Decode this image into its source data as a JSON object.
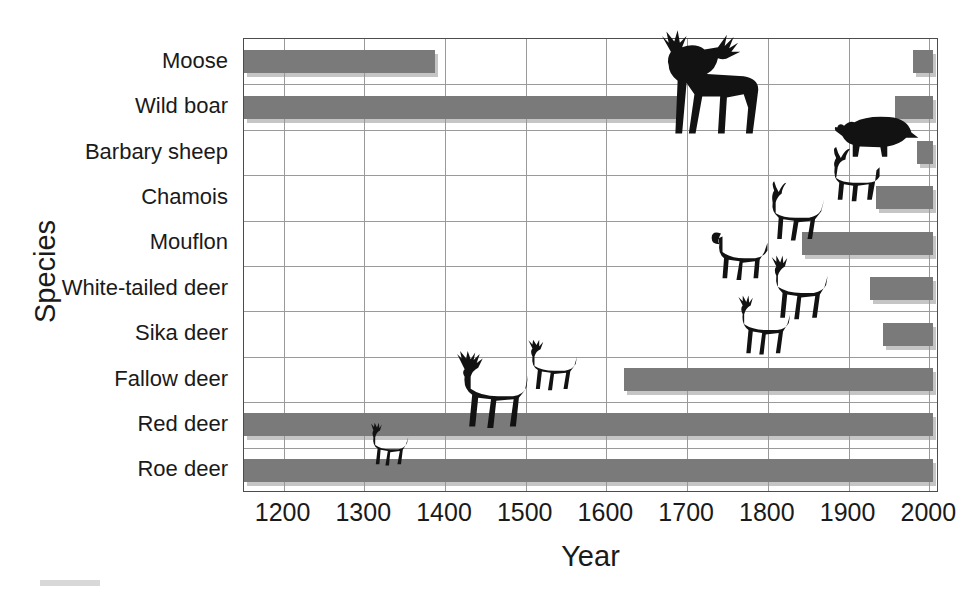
{
  "chart_data": {
    "type": "bar",
    "orientation": "horizontal",
    "title": "",
    "xlabel": "Year",
    "ylabel": "Species",
    "xlim": [
      1151,
      2012
    ],
    "xticks": [
      1200,
      1300,
      1400,
      1500,
      1600,
      1700,
      1800,
      1900,
      2000
    ],
    "xtick_labels": [
      "1200",
      "1300",
      "1400",
      "1500",
      "1600",
      "1700",
      "1800",
      "1900",
      "2000"
    ],
    "categories": [
      "Moose",
      "Wild boar",
      "Barbary sheep",
      "Chamois",
      "Mouflon",
      "White-tailed deer",
      "Sika deer",
      "Fallow deer",
      "Red deer",
      "Roe deer"
    ],
    "grid": "both",
    "legend": "none",
    "bar_color": "#7a7a7a",
    "bars": [
      {
        "species": "Moose",
        "segments": [
          [
            1151,
            1388
          ],
          [
            1980,
            2005
          ]
        ]
      },
      {
        "species": "Wild boar",
        "segments": [
          [
            1151,
            1688
          ],
          [
            1957,
            2005
          ]
        ]
      },
      {
        "species": "Barbary sheep",
        "segments": [
          [
            1985,
            2005
          ]
        ]
      },
      {
        "species": "Chamois",
        "segments": [
          [
            1934,
            2005
          ]
        ]
      },
      {
        "species": "Mouflon",
        "segments": [
          [
            1842,
            2005
          ]
        ]
      },
      {
        "species": "White-tailed deer",
        "segments": [
          [
            1927,
            2005
          ]
        ]
      },
      {
        "species": "Sika deer",
        "segments": [
          [
            1943,
            2005
          ]
        ]
      },
      {
        "species": "Fallow deer",
        "segments": [
          [
            1622,
            2005
          ]
        ]
      },
      {
        "species": "Red deer",
        "segments": [
          [
            1151,
            2005
          ]
        ]
      },
      {
        "species": "Roe deer",
        "segments": [
          [
            1151,
            2005
          ]
        ]
      }
    ],
    "silhouettes": [
      {
        "species": "Moose",
        "icon": "moose-silhouette"
      },
      {
        "species": "Wild boar",
        "icon": "wild-boar-silhouette"
      },
      {
        "species": "Barbary sheep",
        "icon": "barbary-sheep-silhouette"
      },
      {
        "species": "Chamois",
        "icon": "chamois-silhouette"
      },
      {
        "species": "Mouflon",
        "icon": "mouflon-silhouette"
      },
      {
        "species": "White-tailed deer",
        "icon": "white-tailed-deer-silhouette"
      },
      {
        "species": "Sika deer",
        "icon": "sika-deer-silhouette"
      },
      {
        "species": "Fallow deer",
        "icon": "fallow-deer-silhouette"
      },
      {
        "species": "Red deer",
        "icon": "red-deer-silhouette"
      },
      {
        "species": "Roe deer",
        "icon": "roe-deer-silhouette"
      }
    ]
  },
  "axis": {
    "y_title": "Species",
    "x_title": "Year"
  }
}
